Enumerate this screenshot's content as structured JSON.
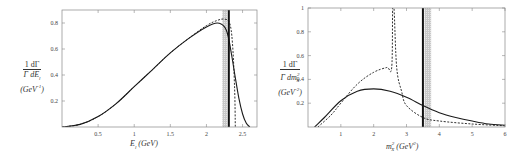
{
  "chart_data": [
    {
      "type": "line",
      "title": "",
      "xlabel": "E_l (GeV)",
      "ylabel": "1/Γ dΓ/dE_l (GeV^-1)",
      "xlim": [
        0,
        2.7
      ],
      "ylim": [
        0,
        0.9
      ],
      "xticks": [
        0.5,
        1,
        1.5,
        2,
        2.5
      ],
      "yticks": [
        0.2,
        0.4,
        0.6,
        0.8
      ],
      "grid": false,
      "legend": null,
      "series": [
        {
          "name": "solid",
          "style": "solid",
          "x": [
            0,
            0.25,
            0.5,
            0.75,
            1.0,
            1.25,
            1.5,
            1.75,
            2.0,
            2.15,
            2.25,
            2.3,
            2.35,
            2.4,
            2.45,
            2.5,
            2.55,
            2.6
          ],
          "y": [
            0,
            0.02,
            0.08,
            0.18,
            0.31,
            0.44,
            0.57,
            0.68,
            0.77,
            0.8,
            0.77,
            0.7,
            0.55,
            0.38,
            0.22,
            0.1,
            0.03,
            0
          ]
        },
        {
          "name": "dashed",
          "style": "dashed",
          "x": [
            0,
            0.25,
            0.5,
            0.75,
            1.0,
            1.25,
            1.5,
            1.75,
            2.0,
            2.15,
            2.25,
            2.32,
            2.36,
            2.39,
            2.4
          ],
          "y": [
            0,
            0.02,
            0.08,
            0.18,
            0.31,
            0.44,
            0.57,
            0.68,
            0.78,
            0.82,
            0.83,
            0.8,
            0.65,
            0.3,
            0
          ]
        }
      ],
      "annotations": [
        {
          "type": "vline",
          "x": 2.31,
          "style": "thick solid"
        },
        {
          "type": "shaded-band",
          "x0": 2.22,
          "x1": 2.29
        }
      ]
    },
    {
      "type": "line",
      "title": "",
      "xlabel": "m_X^2 (GeV^2)",
      "ylabel": "1/Γ dΓ/dm_X^2 (GeV^-2)",
      "xlim": [
        0,
        6
      ],
      "ylim": [
        0,
        1
      ],
      "xticks": [
        1,
        2,
        3,
        4,
        5,
        6
      ],
      "yticks": [
        0.2,
        0.4,
        0.6,
        0.8,
        1
      ],
      "grid": false,
      "legend": null,
      "series": [
        {
          "name": "solid",
          "style": "solid",
          "x": [
            0.2,
            0.5,
            1.0,
            1.5,
            2.0,
            2.5,
            3.0,
            3.5,
            4.0,
            4.5,
            5.0,
            5.5,
            6.0
          ],
          "y": [
            0,
            0.08,
            0.22,
            0.3,
            0.32,
            0.3,
            0.25,
            0.18,
            0.12,
            0.08,
            0.05,
            0.025,
            0.015
          ]
        },
        {
          "name": "dashed",
          "style": "dashed",
          "x": [
            0.3,
            0.7,
            1.0,
            1.5,
            2.0,
            2.4,
            2.55,
            2.58,
            2.62,
            2.7,
            2.85,
            3.0,
            3.5,
            4.0,
            5.0,
            6.0
          ],
          "y": [
            0,
            0.1,
            0.2,
            0.36,
            0.46,
            0.5,
            0.5,
            1.0,
            1.0,
            0.5,
            0.3,
            0.18,
            0.08,
            0.05,
            0.025,
            0.01
          ]
        }
      ],
      "annotations": [
        {
          "type": "vline",
          "x": 3.5,
          "style": "thick solid"
        },
        {
          "type": "shaded-band",
          "x0": 3.55,
          "x1": 3.75
        }
      ]
    }
  ],
  "left": {
    "xlabel": "E",
    "xlabel_sub": "l",
    "xlabel_unit": " (GeV)",
    "ylabel_num": "1  dΓ",
    "ylabel_den": "Γ dE",
    "ylabel_den_sub": "l",
    "ylabel_unit": "(GeV",
    "ylabel_unit_sup": "-1",
    "ylabel_unit_close": ")",
    "xticks": [
      "0.5",
      "1",
      "1.5",
      "2",
      "2.5"
    ],
    "yticks": [
      "0.2",
      "0.4",
      "0.6",
      "0.8"
    ]
  },
  "right": {
    "xlabel": "m",
    "xlabel_sub": "X",
    "xlabel_sup": "2",
    "xlabel_unit": " (GeV",
    "xlabel_unit_sup": "2",
    "xlabel_unit_close": ")",
    "ylabel_num": "1  dΓ",
    "ylabel_den": "Γ dm",
    "ylabel_den_sub": "X",
    "ylabel_den_sup": "2",
    "ylabel_unit": "(GeV",
    "ylabel_unit_sup": "-2",
    "ylabel_unit_close": ")",
    "xticks": [
      "1",
      "2",
      "3",
      "4",
      "5",
      "6"
    ],
    "yticks": [
      "0.2",
      "0.4",
      "0.6",
      "0.8",
      "1"
    ]
  },
  "colors": {
    "line": "#1a1a1a",
    "frame": "#888888",
    "band": "#c8c8c8"
  }
}
